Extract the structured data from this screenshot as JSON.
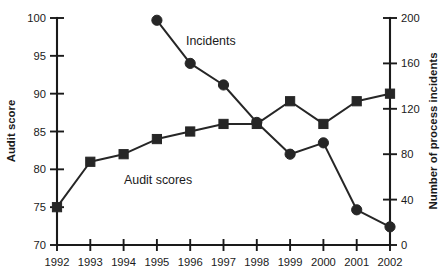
{
  "chart_data": {
    "type": "line",
    "title": "",
    "xlabel": "",
    "categories": [
      "1992",
      "1993",
      "1994",
      "1995",
      "1996",
      "1997",
      "1998",
      "1999",
      "2000",
      "2001",
      "2002"
    ],
    "grid": false,
    "legend_position": "inline-annotation",
    "axes": {
      "left": {
        "label": "Audit score",
        "ylim": [
          70,
          100
        ],
        "ticks": [
          70,
          75,
          80,
          85,
          90,
          95,
          100
        ],
        "tick_labels": [
          "70",
          "75",
          "80",
          "85",
          "90",
          "95",
          "100"
        ]
      },
      "right": {
        "label": "Number of process incidents",
        "ylim": [
          0,
          200
        ],
        "ticks": [
          0,
          40,
          80,
          120,
          160,
          200
        ],
        "tick_labels": [
          "0",
          "40",
          "80",
          "120",
          "160",
          "200"
        ]
      },
      "x": {
        "tick_labels": [
          "1992",
          "1993",
          "1994",
          "1995",
          "1996",
          "1997",
          "1998",
          "1999",
          "2000",
          "2001",
          "2002"
        ]
      }
    },
    "series": [
      {
        "name": "Audit scores",
        "marker": "square",
        "axis": "left",
        "x": [
          "1992",
          "1993",
          "1994",
          "1995",
          "1996",
          "1997",
          "1998",
          "1999",
          "2000",
          "2001",
          "2002"
        ],
        "values": [
          75,
          81,
          82,
          84,
          85,
          86,
          86,
          89,
          86,
          89,
          90
        ],
        "annotation": "Audit scores"
      },
      {
        "name": "Incidents",
        "marker": "circle",
        "axis": "right",
        "x": [
          "1995",
          "1996",
          "1997",
          "1998",
          "1999",
          "2000",
          "2001",
          "2002"
        ],
        "values": [
          198,
          160,
          141,
          108,
          80,
          90,
          31,
          16
        ],
        "annotation": "Incidents"
      }
    ],
    "annotations": [
      {
        "text": "Incidents",
        "x": 1996.0,
        "y_axis": "right"
      },
      {
        "text": "Audit scores",
        "x": 1995.0,
        "y_axis": "left"
      }
    ],
    "colors": {
      "series": "#262626",
      "axis": "#1a1a1a",
      "background": "#ffffff"
    }
  }
}
